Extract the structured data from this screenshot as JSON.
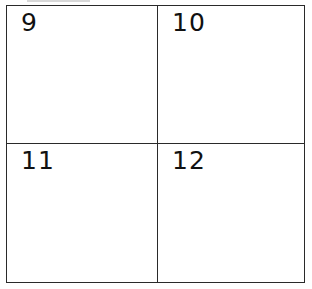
{
  "grid": {
    "rows": 2,
    "columns": 2,
    "border_color": "#2a2a2a",
    "cells": [
      {
        "label": "9"
      },
      {
        "label": "10"
      },
      {
        "label": "11"
      },
      {
        "label": "12"
      }
    ]
  }
}
